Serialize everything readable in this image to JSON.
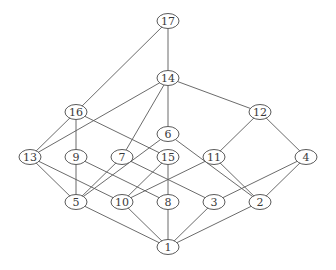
{
  "diagram": {
    "type": "hasse-diagram",
    "colors": {
      "stroke": "#5a5a5a",
      "text": "#3a3a3a",
      "background": "#ffffff"
    },
    "nodes": [
      {
        "id": "17",
        "label": "17",
        "x": 168,
        "y": 21
      },
      {
        "id": "14",
        "label": "14",
        "x": 168,
        "y": 78
      },
      {
        "id": "16",
        "label": "16",
        "x": 76,
        "y": 112
      },
      {
        "id": "12",
        "label": "12",
        "x": 260,
        "y": 112
      },
      {
        "id": "6",
        "label": "6",
        "x": 168,
        "y": 134
      },
      {
        "id": "13",
        "label": "13",
        "x": 30,
        "y": 157
      },
      {
        "id": "9",
        "label": "9",
        "x": 76,
        "y": 157
      },
      {
        "id": "7",
        "label": "7",
        "x": 122,
        "y": 157
      },
      {
        "id": "15",
        "label": "15",
        "x": 168,
        "y": 157
      },
      {
        "id": "11",
        "label": "11",
        "x": 214,
        "y": 157
      },
      {
        "id": "4",
        "label": "4",
        "x": 306,
        "y": 157
      },
      {
        "id": "5",
        "label": "5",
        "x": 76,
        "y": 202
      },
      {
        "id": "10",
        "label": "10",
        "x": 122,
        "y": 202
      },
      {
        "id": "8",
        "label": "8",
        "x": 168,
        "y": 202
      },
      {
        "id": "3",
        "label": "3",
        "x": 214,
        "y": 202
      },
      {
        "id": "2",
        "label": "2",
        "x": 260,
        "y": 202
      },
      {
        "id": "1",
        "label": "1",
        "x": 168,
        "y": 247
      }
    ],
    "edges": [
      [
        "17",
        "14"
      ],
      [
        "17",
        "16"
      ],
      [
        "14",
        "13"
      ],
      [
        "14",
        "7"
      ],
      [
        "14",
        "6"
      ],
      [
        "14",
        "12"
      ],
      [
        "16",
        "13"
      ],
      [
        "16",
        "9"
      ],
      [
        "16",
        "15"
      ],
      [
        "12",
        "11"
      ],
      [
        "12",
        "4"
      ],
      [
        "6",
        "5"
      ],
      [
        "6",
        "2"
      ],
      [
        "13",
        "5"
      ],
      [
        "13",
        "10"
      ],
      [
        "9",
        "5"
      ],
      [
        "9",
        "8"
      ],
      [
        "7",
        "5"
      ],
      [
        "7",
        "3"
      ],
      [
        "15",
        "10"
      ],
      [
        "15",
        "8"
      ],
      [
        "11",
        "10"
      ],
      [
        "11",
        "2"
      ],
      [
        "4",
        "3"
      ],
      [
        "4",
        "2"
      ],
      [
        "5",
        "1"
      ],
      [
        "10",
        "1"
      ],
      [
        "8",
        "1"
      ],
      [
        "3",
        "1"
      ],
      [
        "2",
        "1"
      ]
    ]
  }
}
